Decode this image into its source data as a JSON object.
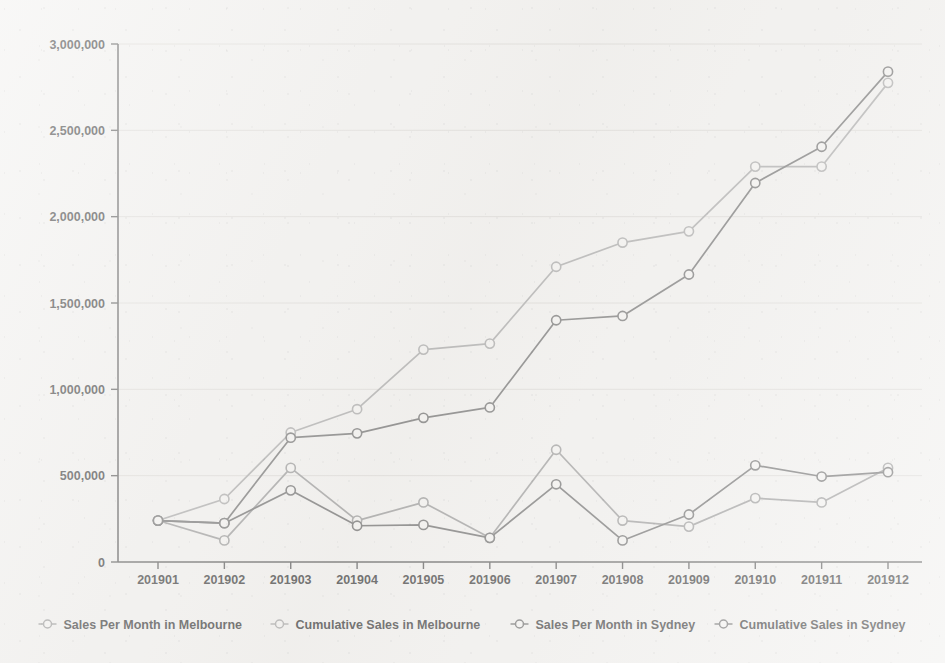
{
  "chart_data": {
    "type": "line",
    "title": "",
    "subtitle": "",
    "xlabel": "",
    "ylabel": "",
    "categories": [
      "201901",
      "201902",
      "201903",
      "201904",
      "201905",
      "201906",
      "201907",
      "201908",
      "201909",
      "201910",
      "201911",
      "201912"
    ],
    "ylim": [
      0,
      3000000
    ],
    "xlim_note": "categorical months 201901-201912",
    "y_ticks": [
      0,
      500000,
      1000000,
      1500000,
      2000000,
      2500000,
      3000000
    ],
    "y_tick_labels": [
      "0",
      "500,000",
      "1,000,000",
      "1,500,000",
      "2,000,000",
      "2,500,000",
      "3,000,000"
    ],
    "x_tick_labels": [
      "201901",
      "201902",
      "201903",
      "201904",
      "201905",
      "201906",
      "201907",
      "201908",
      "201909",
      "201910",
      "201911",
      "201912"
    ],
    "grid": "horizontal",
    "legend_position": "bottom",
    "marker": "circle-open",
    "series": [
      {
        "name": "Sales Per Month in Melbourne",
        "color": "#9a9a9a",
        "values": [
          240000,
          125000,
          545000,
          240000,
          345000,
          140000,
          650000,
          240000,
          205000,
          370000,
          345000,
          545000
        ]
      },
      {
        "name": "Cumulative Sales in Melbourne",
        "color": "#a8a8a8",
        "values": [
          240000,
          365000,
          750000,
          885000,
          1230000,
          1265000,
          1710000,
          1850000,
          1915000,
          2290000,
          2290000,
          2775000
        ]
      },
      {
        "name": "Sales Per Month in Sydney",
        "color": "#6e6e6e",
        "values": [
          240000,
          225000,
          415000,
          210000,
          215000,
          140000,
          450000,
          125000,
          275000,
          560000,
          495000,
          520000
        ]
      },
      {
        "name": "Cumulative Sales in Sydney",
        "color": "#707070",
        "values": [
          240000,
          225000,
          720000,
          745000,
          835000,
          895000,
          1400000,
          1425000,
          1665000,
          2195000,
          2405000,
          2840000
        ]
      }
    ]
  },
  "legend": {
    "items": [
      {
        "label": "Sales Per Month in Melbourne",
        "color": "#9a9a9a"
      },
      {
        "label": "Cumulative Sales in Melbourne",
        "color": "#a8a8a8"
      },
      {
        "label": "Sales Per Month in Sydney",
        "color": "#6e6e6e"
      },
      {
        "label": "Cumulative Sales in Sydney",
        "color": "#707070"
      }
    ]
  },
  "theme": {
    "background": "#f2f1ef",
    "grid_color": "#dcdad6",
    "axis_color": "#595959",
    "text_color": "#3b3b3b"
  }
}
